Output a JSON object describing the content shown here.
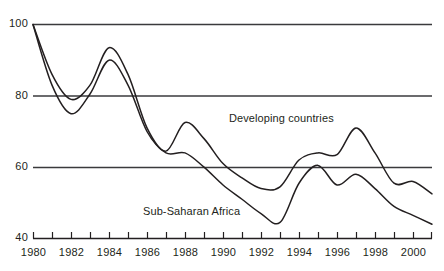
{
  "chart_data": {
    "type": "line",
    "title": "",
    "subtitle": "",
    "xlabel": "",
    "ylabel": "",
    "xlim": [
      1980,
      2001
    ],
    "ylim": [
      40,
      100
    ],
    "grid": true,
    "gridlines_y": [
      40,
      60,
      80,
      100
    ],
    "legend_position": "inline-annotations",
    "y_ticks": [
      {
        "value": 100,
        "label": "100"
      },
      {
        "value": 80,
        "label": "80"
      },
      {
        "value": 60,
        "label": "60"
      },
      {
        "value": 40,
        "label": "40"
      }
    ],
    "x_ticks": [
      {
        "value": 1980,
        "label": "1980"
      },
      {
        "value": 1981,
        "label": ""
      },
      {
        "value": 1982,
        "label": "1982"
      },
      {
        "value": 1983,
        "label": ""
      },
      {
        "value": 1984,
        "label": "1984"
      },
      {
        "value": 1985,
        "label": ""
      },
      {
        "value": 1986,
        "label": "1986"
      },
      {
        "value": 1987,
        "label": ""
      },
      {
        "value": 1988,
        "label": "1988"
      },
      {
        "value": 1989,
        "label": ""
      },
      {
        "value": 1990,
        "label": "1990"
      },
      {
        "value": 1991,
        "label": ""
      },
      {
        "value": 1992,
        "label": "1992"
      },
      {
        "value": 1993,
        "label": ""
      },
      {
        "value": 1994,
        "label": "1994"
      },
      {
        "value": 1995,
        "label": ""
      },
      {
        "value": 1996,
        "label": "1996"
      },
      {
        "value": 1997,
        "label": ""
      },
      {
        "value": 1998,
        "label": "1998"
      },
      {
        "value": 1999,
        "label": ""
      },
      {
        "value": 2000,
        "label": "2000"
      },
      {
        "value": 2001,
        "label": ""
      }
    ],
    "x": [
      1980,
      1981,
      1982,
      1983,
      1984,
      1985,
      1986,
      1987,
      1988,
      1989,
      1990,
      1991,
      1992,
      1993,
      1994,
      1995,
      1996,
      1997,
      1998,
      1999,
      2000,
      2001
    ],
    "series": [
      {
        "name": "Developing countries",
        "color": "#231f20",
        "values": [
          100,
          86,
          79,
          83,
          93.5,
          86,
          71,
          64.5,
          72.5,
          68,
          61,
          57,
          54,
          54.5,
          62,
          64,
          63.5,
          71,
          64,
          55.5,
          56,
          52.5
        ]
      },
      {
        "name": "Sub-Saharan Africa",
        "color": "#231f20",
        "values": [
          100,
          83,
          75,
          80.5,
          90,
          83,
          70,
          64,
          64,
          60,
          55,
          51,
          47,
          44.5,
          55.5,
          60.5,
          55,
          58,
          54,
          49,
          46.5,
          44
        ]
      }
    ],
    "annotations": [
      {
        "text": "Developing countries",
        "x_px": 229,
        "y_px": 112
      },
      {
        "text": "Sub-Saharan Africa",
        "x_px": 143,
        "y_px": 205
      }
    ]
  },
  "axis_colors": {
    "line": "#231f20",
    "gridline": "#3a3a3c",
    "background": "#ffffff"
  }
}
